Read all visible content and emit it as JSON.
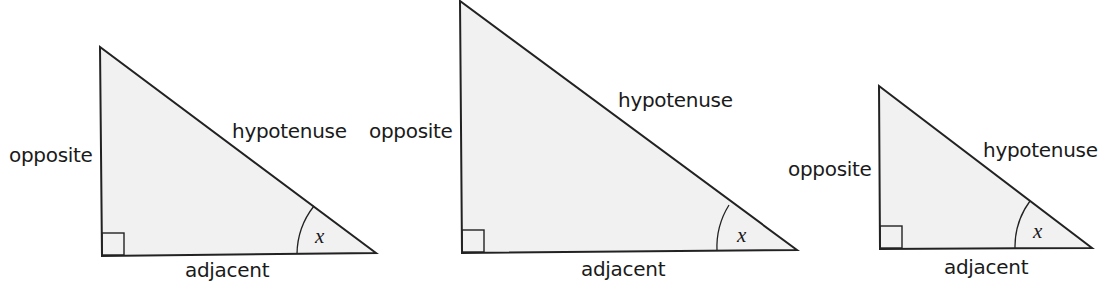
{
  "diagram": {
    "colors": {
      "fill": "#f1f1f1",
      "stroke": "#222222",
      "text": "#1a1a1a"
    },
    "triangles": [
      {
        "opposite_label": "opposite",
        "hypotenuse_label": "hypotenuse",
        "adjacent_label": "adjacent",
        "angle_label": "x"
      },
      {
        "opposite_label": "opposite",
        "hypotenuse_label": "hypotenuse",
        "adjacent_label": "adjacent",
        "angle_label": "x"
      },
      {
        "opposite_label": "opposite",
        "hypotenuse_label": "hypotenuse",
        "adjacent_label": "adjacent",
        "angle_label": "x"
      }
    ]
  }
}
